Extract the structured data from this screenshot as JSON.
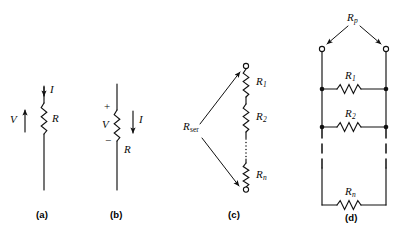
{
  "figure": {
    "background_color": "#ffffff",
    "line_color": "#111111",
    "panels": [
      {
        "id": "a",
        "caption": "(a)",
        "description": "Single resistor on a vertical wire with current arrow pointing down into the resistor and voltage arrow pointing up",
        "labels": {
          "current": "I",
          "voltage": "V",
          "resistor": "R"
        }
      },
      {
        "id": "b",
        "caption": "(b)",
        "description": "Single resistor with plus sign above and minus sign below, voltage V across it and current arrow pointing down",
        "labels": {
          "plus": "+",
          "minus": "−",
          "current": "I",
          "voltage": "V",
          "resistor": "R"
        }
      },
      {
        "id": "c",
        "caption": "(c)",
        "description": "Series combination of resistors between two open terminals, labeled R sub ser with two leader arrows",
        "labels": {
          "equivalent": "R",
          "equivalent_sub": "ser",
          "resistors": [
            {
              "name": "R",
              "sub": "1"
            },
            {
              "name": "R",
              "sub": "2"
            },
            {
              "name": "R",
              "sub": "n"
            }
          ]
        }
      },
      {
        "id": "d",
        "caption": "(d)",
        "description": "Parallel combination of resistors between two open terminals, labeled R sub p with two leader arrows",
        "labels": {
          "equivalent": "R",
          "equivalent_sub": "p",
          "resistors": [
            {
              "name": "R",
              "sub": "1"
            },
            {
              "name": "R",
              "sub": "2"
            },
            {
              "name": "R",
              "sub": "n"
            }
          ]
        }
      }
    ]
  }
}
